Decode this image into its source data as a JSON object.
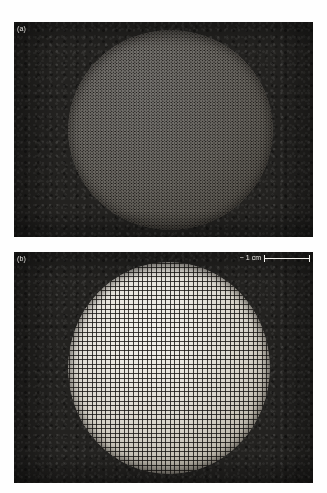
{
  "figure": {
    "panels": [
      {
        "id": "panel-a",
        "label": "(a)",
        "description": "Dark-field micrograph of a spherical colloidal crystal with dense hexagonal particle lattice"
      },
      {
        "id": "panel-b",
        "label": "(b)",
        "description": "Dark-field micrograph of a spherical colloidal crystal with coarse square particle lattice"
      }
    ],
    "scale_bar": {
      "approx_symbol": "~",
      "value": "1",
      "unit": "cm",
      "text": "~ 1 cm",
      "left_tick": "|",
      "right_tick": "|"
    },
    "colors": {
      "background": "#ffffff",
      "panel_dark": "#232220",
      "sphere_light": "#e7e4dd",
      "label_text": "#e8e6e2"
    }
  }
}
